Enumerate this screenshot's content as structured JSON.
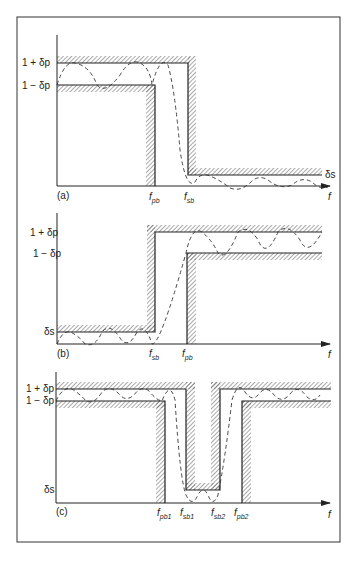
{
  "figure": {
    "panels": [
      {
        "id": "a",
        "label": "(a)",
        "type": "lowpass",
        "y_labels": {
          "upper": "1 + δp",
          "lower": "1 − δp",
          "stop": "δs"
        },
        "x_labels": [
          {
            "text": "f",
            "sub": "pb"
          },
          {
            "text": "f",
            "sub": "sb"
          }
        ],
        "axis_label": "f"
      },
      {
        "id": "b",
        "label": "(b)",
        "type": "highpass",
        "y_labels": {
          "upper": "1 + δp",
          "lower": "1 − δp",
          "stop": "δs"
        },
        "x_labels": [
          {
            "text": "f",
            "sub": "sb"
          },
          {
            "text": "f",
            "sub": "pb"
          }
        ],
        "axis_label": "f"
      },
      {
        "id": "c",
        "label": "(c)",
        "type": "bandstop",
        "y_labels": {
          "upper": "1 + δp",
          "lower": "1 − δp",
          "stop": "δs"
        },
        "x_labels": [
          {
            "text": "f",
            "sub": "pb1"
          },
          {
            "text": "f",
            "sub": "sb1"
          },
          {
            "text": "f",
            "sub": "sb2"
          },
          {
            "text": "f",
            "sub": "pb2"
          }
        ],
        "axis_label": "f"
      }
    ],
    "colors": {
      "line": "#222222",
      "hatch": "#555555",
      "frame": "#333333",
      "background": "#ffffff"
    }
  }
}
